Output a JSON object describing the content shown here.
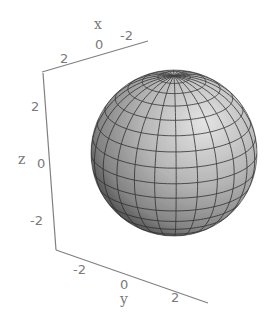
{
  "chart_data": {
    "type": "surface3d",
    "title": "",
    "surface": "sphere",
    "center": [
      0,
      0,
      0
    ],
    "radius": 3,
    "mesh": {
      "latitude_bands": 16,
      "longitude_bands": 24
    },
    "axes": {
      "x": {
        "label": "x",
        "ticks": [
          "2",
          "0",
          "-2"
        ],
        "range": [
          -3,
          3
        ]
      },
      "y": {
        "label": "y",
        "ticks": [
          "-2",
          "0",
          "2"
        ],
        "range": [
          -3,
          3
        ]
      },
      "z": {
        "label": "z",
        "ticks": [
          "2",
          "0",
          "-2"
        ],
        "range": [
          -3,
          3
        ]
      }
    },
    "boxed": false,
    "shading": "grayscale lit",
    "colors": {
      "surface_light": "#d8d8d8",
      "surface_dark": "#2e2e2e",
      "mesh": "#2a2a2a",
      "axis": "#808080"
    }
  },
  "labels": {
    "x_axis_name": "x",
    "x_ticks": [
      "2",
      "0",
      "-2"
    ],
    "y_axis_name": "y",
    "y_ticks": [
      "-2",
      "0",
      "2"
    ],
    "z_axis_name": "z",
    "z_ticks": [
      "2",
      "0",
      "-2"
    ]
  }
}
